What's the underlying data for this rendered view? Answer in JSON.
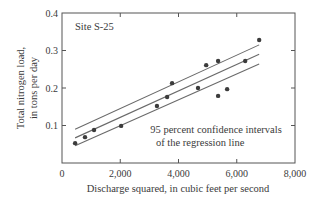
{
  "chart_data": {
    "type": "scatter",
    "title": "",
    "annotation_site": "Site S-25",
    "annotation_ci": [
      "95 percent confidence intervals",
      "of the regression line"
    ],
    "xlabel": "Discharge squared, in cubic feet per second",
    "ylabel": [
      "Total nitrogen load,",
      "in tons per day"
    ],
    "xlim": [
      0,
      8000
    ],
    "ylim": [
      0,
      0.4
    ],
    "x_ticks": [
      0,
      2000,
      4000,
      6000,
      8000
    ],
    "x_tick_labels": [
      "0",
      "2,000",
      "4,000",
      "6,000",
      "8,000"
    ],
    "y_ticks": [
      0.1,
      0.2,
      0.3,
      0.4
    ],
    "y_tick_labels": [
      "0.1",
      "0.2",
      "0.3",
      "0.4"
    ],
    "grid": false,
    "legend": null,
    "series": [
      {
        "name": "Observations",
        "kind": "points",
        "points": [
          [
            450,
            0.053
          ],
          [
            790,
            0.069
          ],
          [
            1100,
            0.088
          ],
          [
            2030,
            0.099
          ],
          [
            3260,
            0.152
          ],
          [
            3610,
            0.176
          ],
          [
            3780,
            0.213
          ],
          [
            4670,
            0.2
          ],
          [
            4950,
            0.261
          ],
          [
            5360,
            0.272
          ],
          [
            5360,
            0.179
          ],
          [
            5670,
            0.197
          ],
          [
            6290,
            0.272
          ],
          [
            6770,
            0.328
          ]
        ]
      },
      {
        "name": "Regression line",
        "kind": "line",
        "points": [
          [
            450,
            0.067
          ],
          [
            6770,
            0.29
          ]
        ]
      },
      {
        "name": "Upper 95% confidence interval",
        "kind": "line",
        "points": [
          [
            450,
            0.09
          ],
          [
            6770,
            0.315
          ]
        ]
      },
      {
        "name": "Lower 95% confidence interval",
        "kind": "line",
        "points": [
          [
            450,
            0.046
          ],
          [
            6770,
            0.264
          ]
        ]
      }
    ]
  },
  "colors": {
    "axis": "#555555",
    "line": "#6a6a6a",
    "point": "#3c3c3c",
    "text": "#3a3a3a"
  }
}
